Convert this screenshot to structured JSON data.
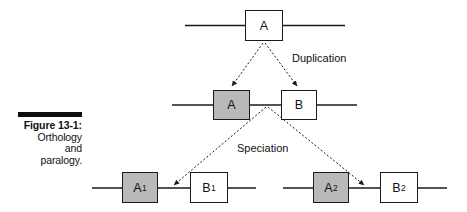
{
  "figure": {
    "caption_title": "Figure 13-1:",
    "caption_lines": [
      "Orthology",
      "and",
      "paralogy."
    ],
    "colors": {
      "shaded_gene_fill": "#b9b9b9",
      "unshaded_gene_fill": "#ffffff",
      "stroke": "#1a1a1a",
      "caption_rule": "#0d0d0d",
      "background": "#ffffff"
    }
  },
  "diagram": {
    "type": "gene-tree-duplication-speciation",
    "event_labels": [
      {
        "name": "duplication",
        "text": "Duplication"
      },
      {
        "name": "speciation",
        "text": "Speciation"
      }
    ],
    "rows": [
      {
        "name": "ancestral-row",
        "genes": [
          {
            "name": "gene-a-ancestral",
            "label": "A",
            "subscript": "",
            "shaded": false
          }
        ]
      },
      {
        "name": "post-duplication-row",
        "genes": [
          {
            "name": "gene-a-duplicate",
            "label": "A",
            "subscript": "",
            "shaded": true
          },
          {
            "name": "gene-b-duplicate",
            "label": "B",
            "subscript": "",
            "shaded": false
          }
        ]
      },
      {
        "name": "post-speciation-row",
        "genes": [
          {
            "name": "gene-a1",
            "label": "A",
            "subscript": "1",
            "shaded": true
          },
          {
            "name": "gene-b1",
            "label": "B",
            "subscript": "1",
            "shaded": false
          },
          {
            "name": "gene-a2",
            "label": "A",
            "subscript": "2",
            "shaded": true
          },
          {
            "name": "gene-b2",
            "label": "B",
            "subscript": "2",
            "shaded": false
          }
        ]
      }
    ]
  }
}
